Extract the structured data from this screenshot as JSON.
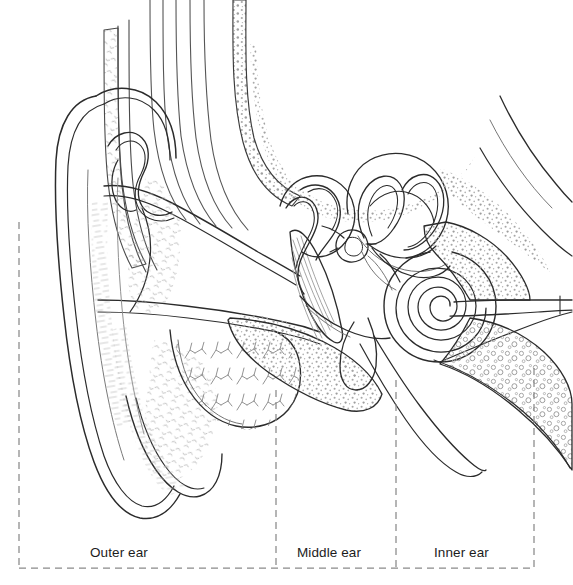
{
  "figure": {
    "kind": "anatomical-line-diagram",
    "width": 573,
    "height": 585,
    "background_color": "#ffffff",
    "ink_color": "#2b2b2b",
    "light_ink_color": "#6f6f6f",
    "stipple_color": "#9a9a9a",
    "dashed_color": "#8a8a8a"
  },
  "regions": [
    {
      "id": "outer",
      "label": "Outer ear",
      "box": {
        "x": 19,
        "y": 222,
        "width": 257,
        "height": 346
      },
      "label_pos": {
        "x": 90,
        "y": 545
      }
    },
    {
      "id": "middle",
      "label": "Middle ear",
      "box": {
        "x": 276,
        "y": 390,
        "width": 120,
        "height": 178
      },
      "label_pos": {
        "x": 297,
        "y": 545
      }
    },
    {
      "id": "inner",
      "label": "Inner ear",
      "box": {
        "x": 396,
        "y": 368,
        "width": 138,
        "height": 200
      },
      "label_pos": {
        "x": 434,
        "y": 545
      }
    }
  ],
  "divider_lines": [
    {
      "name": "outer-left-edge",
      "x": 19,
      "y1": 222,
      "y2": 568
    },
    {
      "name": "outer-middle-divider",
      "x": 276,
      "y1": 390,
      "y2": 568
    },
    {
      "name": "middle-inner-divider",
      "x": 396,
      "y1": 380,
      "y2": 568
    },
    {
      "name": "inner-right-edge",
      "x": 534,
      "y1": 368,
      "y2": 568
    },
    {
      "name": "baseline",
      "y": 568,
      "x1": 19,
      "x2": 534
    }
  ],
  "structures": [
    {
      "name": "pinna-auricle",
      "region": "outer",
      "description": "External ear flap with helix, antihelix, tragus and lobule"
    },
    {
      "name": "helix",
      "region": "outer",
      "description": "Outer curved rim of the pinna"
    },
    {
      "name": "antihelix",
      "region": "outer",
      "description": "Inner Y-shaped ridge of the pinna"
    },
    {
      "name": "tragus",
      "region": "outer",
      "description": "Small flap anterior to the ear canal opening"
    },
    {
      "name": "earlobe",
      "region": "outer",
      "description": "Fleshy lower portion of pinna"
    },
    {
      "name": "ear-canal",
      "region": "outer",
      "description": "External auditory meatus leading inward"
    },
    {
      "name": "cartilage-stipple",
      "region": "outer",
      "description": "Hatched cartilage texture of pinna"
    },
    {
      "name": "temporalis-muscle",
      "region": "outer",
      "description": "Curved vertical muscle fibers above the canal"
    },
    {
      "name": "temporal-bone",
      "region": "middle",
      "description": "Stippled cancellous bone surrounding the canal"
    },
    {
      "name": "tympanic-membrane",
      "region": "middle",
      "description": "Eardrum, fan shaped with radial fibers"
    },
    {
      "name": "malleus",
      "region": "middle",
      "description": "Hammer bone attached to eardrum"
    },
    {
      "name": "incus",
      "region": "middle",
      "description": "Anvil bone articulating with malleus"
    },
    {
      "name": "stapes",
      "region": "middle",
      "description": "Stirrup bone seated in the oval window"
    },
    {
      "name": "tympanic-cavity",
      "region": "middle",
      "description": "Air filled middle ear chamber"
    },
    {
      "name": "mastoid-process",
      "region": "middle",
      "description": "Bony prominence below the ear canal"
    },
    {
      "name": "eustachian-tube",
      "region": "middle",
      "description": "Auditory tube descending toward the pharynx"
    },
    {
      "name": "semicircular-canals",
      "region": "inner",
      "description": "Three looping balance canals"
    },
    {
      "name": "vestibule",
      "region": "inner",
      "description": "Central cavity between canals and cochlea"
    },
    {
      "name": "cochlea",
      "region": "inner",
      "description": "Spiral hearing organ with about two and a half turns"
    },
    {
      "name": "vestibulocochlear-nerve",
      "region": "inner",
      "description": "Eighth cranial nerve running to the right"
    }
  ]
}
